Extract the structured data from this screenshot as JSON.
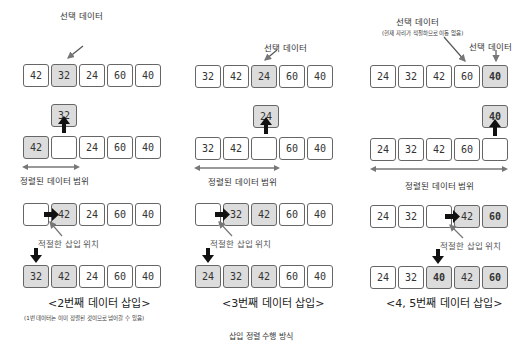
{
  "panel1": {
    "selected_label": "선택 데이터",
    "row1": [
      "42",
      "32",
      "24",
      "60",
      "40"
    ],
    "lifted": "32",
    "row2": [
      "42",
      "",
      "24",
      "60",
      "40"
    ],
    "range_label": "정렬된 데이터 범위",
    "row3": [
      "",
      "42",
      "24",
      "60",
      "40"
    ],
    "insert_label": "적절한 삽입 위치",
    "row4": [
      "32",
      "42",
      "24",
      "60",
      "40"
    ],
    "caption": "<2번째 데이터 삽입>",
    "note": "(1번 데이터는 이미 정렬된 것이므로 넘어갈 수 있음)"
  },
  "panel2": {
    "selected_label": "선택 데이터",
    "row1": [
      "32",
      "42",
      "24",
      "60",
      "40"
    ],
    "lifted": "24",
    "row2": [
      "32",
      "42",
      "",
      "60",
      "40"
    ],
    "range_label": "정렬된 데이터 범위",
    "row3": [
      "",
      "32",
      "42",
      "60",
      "40"
    ],
    "insert_label": "적절한 삽입 위치",
    "row4": [
      "24",
      "32",
      "42",
      "60",
      "40"
    ],
    "caption": "<3번째 데이터 삽입>"
  },
  "panel3": {
    "selected_label_a": "선택 데이터",
    "selected_note_a": "(현재 자리가 적절하므로 이동 없음)",
    "selected_label_b": "선택 데이터",
    "row1": [
      "24",
      "32",
      "42",
      "60",
      "40"
    ],
    "lifted": "40",
    "row2": [
      "24",
      "32",
      "42",
      "60",
      ""
    ],
    "range_label": "정렬된 데이터 범위",
    "row3": [
      "24",
      "32",
      "",
      "42",
      "60"
    ],
    "insert_label": "적절한 삽입 위치",
    "row4": [
      "24",
      "32",
      "40",
      "42",
      "60"
    ],
    "caption": "<4, 5번째 데이터 삽입>"
  },
  "footer": {
    "title": "삽입 정렬 수행 방식"
  },
  "colors": {
    "highlight": "#dcdcdc",
    "border": "#666666",
    "arrow_gray": "#777777",
    "arrow_black": "#111111"
  }
}
